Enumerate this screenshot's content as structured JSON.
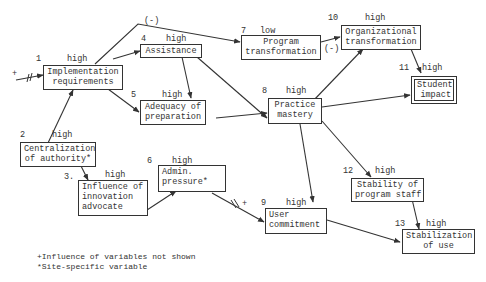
{
  "nodes": [
    {
      "id": 1,
      "num": "1",
      "level": "high",
      "label": "Implementation\nrequirements"
    },
    {
      "id": 2,
      "num": "2",
      "level": "high",
      "label": "Centralization\nof authority*"
    },
    {
      "id": 3,
      "num": "3.",
      "level": "high",
      "label": "Influence of\ninnovation\nadvocate"
    },
    {
      "id": 4,
      "num": "4",
      "level": "high",
      "label": "Assistance"
    },
    {
      "id": 5,
      "num": "5",
      "level": "high",
      "label": "Adequacy of\npreparation"
    },
    {
      "id": 6,
      "num": "6",
      "level": "high",
      "label": "Admin.\npressure*"
    },
    {
      "id": 7,
      "num": "7",
      "level": "low",
      "label": "Program\ntransformation"
    },
    {
      "id": 8,
      "num": "8",
      "level": "high",
      "label": "Practice\nmastery"
    },
    {
      "id": 9,
      "num": "9",
      "level": "high",
      "label": "User\ncommitment"
    },
    {
      "id": 10,
      "num": "10",
      "level": "high",
      "label": "Organizational\ntransformation"
    },
    {
      "id": 11,
      "num": "11",
      "level": "high",
      "label": "Student\nimpact"
    },
    {
      "id": 12,
      "num": "12",
      "level": "high",
      "label": "Stability of\nprogram staff"
    },
    {
      "id": 13,
      "num": "13",
      "level": "high",
      "label": "Stabilization\nof use"
    }
  ],
  "edges": [
    {
      "from": "external",
      "to": 1,
      "sign": "+",
      "broken": true
    },
    {
      "from": 2,
      "to": 1
    },
    {
      "from": 1,
      "to": 4
    },
    {
      "from": 1,
      "to": 5
    },
    {
      "from": 1,
      "to": 7,
      "sign": "(-)"
    },
    {
      "from": 4,
      "to": 5
    },
    {
      "from": 4,
      "to": 8
    },
    {
      "from": 5,
      "to": 8
    },
    {
      "from": 2,
      "to": 3
    },
    {
      "from": 3,
      "to": 6
    },
    {
      "from": 6,
      "to": 9,
      "sign": "+",
      "broken": true
    },
    {
      "from": 7,
      "to": 10,
      "sign": "(-)"
    },
    {
      "from": 8,
      "to": 10
    },
    {
      "from": 8,
      "to": 11
    },
    {
      "from": 10,
      "to": 11
    },
    {
      "from": 8,
      "to": 9
    },
    {
      "from": 8,
      "to": 12
    },
    {
      "from": 9,
      "to": 13
    },
    {
      "from": 12,
      "to": 13
    }
  ],
  "signs": {
    "minus": "(-)",
    "plus": "+"
  },
  "legend": {
    "line1": "+Influence of variables not shown",
    "line2": "*Site-specific variable"
  }
}
